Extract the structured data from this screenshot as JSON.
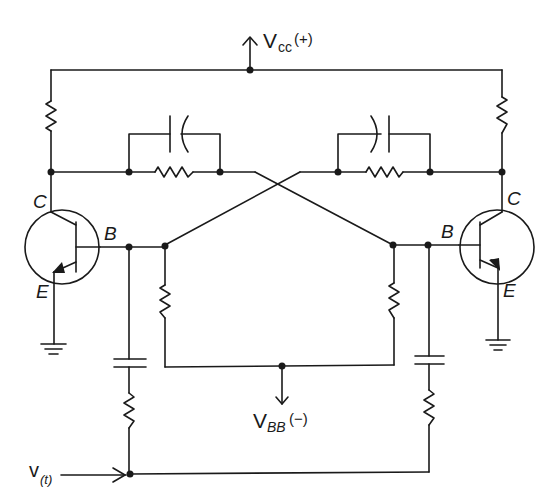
{
  "diagram": {
    "type": "circuit-schematic",
    "colors": {
      "line": "#1a1a1a",
      "background": "#ffffff"
    }
  },
  "labels": {
    "vcc_main": "V",
    "vcc_sub": "cc",
    "vcc_polarity": "(+)",
    "vbb_main": "V",
    "vbb_sub": "BB",
    "vbb_polarity": "(−)",
    "vin_main": "v",
    "vin_sub": "(t)",
    "left_collector": "C",
    "left_base": "B",
    "left_emitter": "E",
    "right_collector": "C",
    "right_base": "B",
    "right_emitter": "E"
  },
  "components": {
    "transistors": [
      {
        "id": "Q1",
        "type": "NPN",
        "side": "left",
        "pins": [
          "C",
          "B",
          "E"
        ]
      },
      {
        "id": "Q2",
        "type": "NPN",
        "side": "right",
        "pins": [
          "C",
          "B",
          "E"
        ]
      }
    ],
    "resistors": [
      "left-collector-load",
      "right-collector-load",
      "left-coupling",
      "right-coupling",
      "left-base-bias",
      "right-base-bias",
      "left-trigger",
      "right-trigger"
    ],
    "capacitors": [
      "left-speedup",
      "right-speedup",
      "left-trigger",
      "right-trigger"
    ],
    "grounds": [
      "left-emitter-ground",
      "right-emitter-ground"
    ]
  }
}
